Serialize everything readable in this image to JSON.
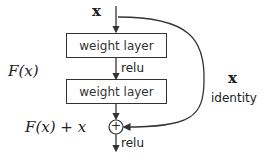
{
  "diagram": {
    "input_label": "x",
    "layers": [
      {
        "label": "weight layer"
      },
      {
        "label": "weight layer"
      }
    ],
    "activation_mid": "relu",
    "activation_out": "relu",
    "residual_label": "F(x)",
    "sum_label": "F(x) + x",
    "shortcut_label": "x",
    "shortcut_name": "identity",
    "sum_symbol": "+"
  }
}
